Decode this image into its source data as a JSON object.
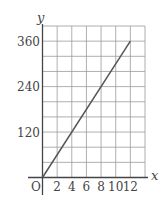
{
  "chart_data": {
    "type": "line",
    "title": "",
    "xlabel": "x",
    "ylabel": "y",
    "origin_label": "O",
    "x": [
      0,
      12
    ],
    "series": [
      {
        "name": "y = 30x",
        "x": [
          0,
          12
        ],
        "values": [
          0,
          360
        ]
      }
    ],
    "x_ticks": [
      2,
      4,
      6,
      8,
      10,
      12
    ],
    "y_ticks": [
      120,
      240,
      360
    ],
    "x_grid_step": 2,
    "y_grid_step": 40,
    "xlim": [
      0,
      14
    ],
    "ylim": [
      0,
      400
    ],
    "grid": true,
    "legend": "none",
    "colors": {
      "line": "#555555",
      "grid": "#9a9a9a",
      "axis": "#444444",
      "text": "#444444"
    }
  }
}
